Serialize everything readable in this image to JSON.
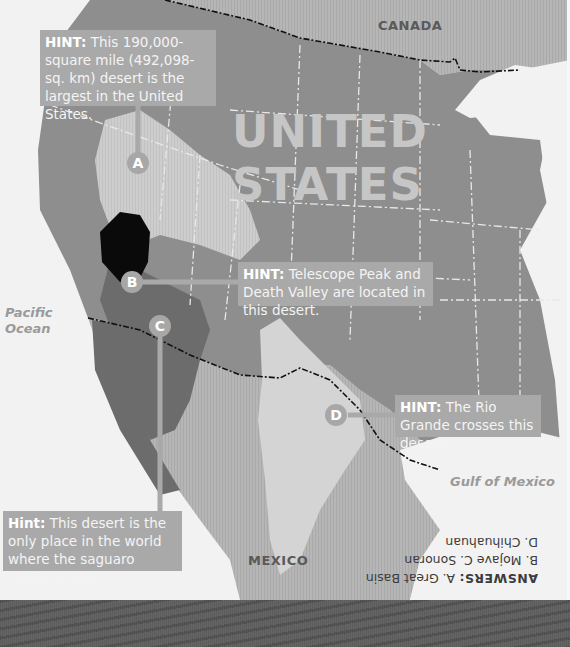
{
  "map": {
    "title_overlay": "UNITED STATES",
    "countries": {
      "canada": "CANADA",
      "mexico": "MEXICO"
    },
    "water_bodies": {
      "pacific_line1": "Pacific",
      "pacific_line2": "Ocean",
      "gulf": "Gulf of Mexico"
    },
    "colors": {
      "background": "#f2f2f2",
      "us_land": "#8e8e8e",
      "canada_land": "#b0b0b0",
      "mexico_land": "#b3b3b3",
      "great_basin": "#c9c9c9",
      "mojave": "#0a0a0a",
      "sonoran": "#6c6c6c",
      "chihuahuan": "#d4d4d4",
      "hint_box": "#a9a9a9",
      "marker": "#a7a7a7",
      "bottom_band": "#5f5f5f"
    }
  },
  "markers": [
    {
      "id": "A",
      "label": "A",
      "desert": "Great Basin"
    },
    {
      "id": "B",
      "label": "B",
      "desert": "Mojave"
    },
    {
      "id": "C",
      "label": "C",
      "desert": "Sonoran"
    },
    {
      "id": "D",
      "label": "D",
      "desert": "Chihuahuan"
    }
  ],
  "hints": {
    "a": {
      "prefix": "HINT:",
      "text": " This 190,000-square mile (492,098-sq. km) desert is the largest in the United States."
    },
    "b": {
      "prefix": "HINT:",
      "text": " Telescope Peak and Death Valley are located in this desert."
    },
    "c": {
      "prefix": "Hint:",
      "text": " This desert is the only place in the world where the saguaro cactus grows."
    },
    "d": {
      "prefix": "HINT:",
      "text": " The Rio Grande crosses this desert."
    }
  },
  "answers": {
    "heading": "ANSWERS:",
    "line1": " A. Great Basin",
    "line2": "B. Mojave  C. Sonoran",
    "line3": "D. Chihuahuan"
  }
}
